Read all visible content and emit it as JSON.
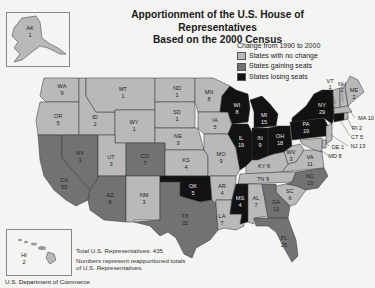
{
  "title": {
    "line1": "Apportionment of the U.S. House of Representatives",
    "line2": "Based on the 2000 Census"
  },
  "legend": {
    "heading": "Change from 1990 to 2000",
    "items": [
      {
        "label": "States with no change",
        "color": "#b9b9b9"
      },
      {
        "label": "States gaining seats",
        "color": "#727272"
      },
      {
        "label": "States losing seats",
        "color": "#121212"
      }
    ]
  },
  "colors": {
    "no_change": "#b9b9b9",
    "gaining": "#727272",
    "losing": "#121212",
    "background": "#f4f4f2"
  },
  "states": {
    "AK": {
      "abbr": "AK",
      "seats": "1",
      "status": "no_change"
    },
    "HI": {
      "abbr": "HI",
      "seats": "2",
      "status": "no_change"
    },
    "WA": {
      "abbr": "WA",
      "seats": "9",
      "status": "no_change"
    },
    "OR": {
      "abbr": "OR",
      "seats": "5",
      "status": "no_change"
    },
    "CA": {
      "abbr": "CA",
      "seats": "53",
      "status": "gaining"
    },
    "ID": {
      "abbr": "ID",
      "seats": "2",
      "status": "no_change"
    },
    "NV": {
      "abbr": "NV",
      "seats": "3",
      "status": "gaining"
    },
    "MT": {
      "abbr": "MT",
      "seats": "1",
      "status": "no_change"
    },
    "WY": {
      "abbr": "WY",
      "seats": "1",
      "status": "no_change"
    },
    "UT": {
      "abbr": "UT",
      "seats": "3",
      "status": "no_change"
    },
    "AZ": {
      "abbr": "AZ",
      "seats": "8",
      "status": "gaining"
    },
    "CO": {
      "abbr": "CO",
      "seats": "7",
      "status": "gaining"
    },
    "NM": {
      "abbr": "NM",
      "seats": "3",
      "status": "no_change"
    },
    "ND": {
      "abbr": "ND",
      "seats": "1",
      "status": "no_change"
    },
    "SD": {
      "abbr": "SD",
      "seats": "1",
      "status": "no_change"
    },
    "NE": {
      "abbr": "NE",
      "seats": "3",
      "status": "no_change"
    },
    "KS": {
      "abbr": "KS",
      "seats": "4",
      "status": "no_change"
    },
    "OK": {
      "abbr": "OK",
      "seats": "5",
      "status": "losing"
    },
    "TX": {
      "abbr": "TX",
      "seats": "32",
      "status": "gaining"
    },
    "MN": {
      "abbr": "MN",
      "seats": "8",
      "status": "no_change"
    },
    "IA": {
      "abbr": "IA",
      "seats": "5",
      "status": "no_change"
    },
    "MO": {
      "abbr": "MO",
      "seats": "9",
      "status": "no_change"
    },
    "AR": {
      "abbr": "AR",
      "seats": "4",
      "status": "no_change"
    },
    "LA": {
      "abbr": "LA",
      "seats": "7",
      "status": "no_change"
    },
    "WI": {
      "abbr": "WI",
      "seats": "8",
      "status": "losing"
    },
    "IL": {
      "abbr": "IL",
      "seats": "19",
      "status": "losing"
    },
    "MS": {
      "abbr": "MS",
      "seats": "4",
      "status": "losing"
    },
    "MI": {
      "abbr": "MI",
      "seats": "15",
      "status": "losing"
    },
    "IN": {
      "abbr": "IN",
      "seats": "9",
      "status": "losing"
    },
    "OH": {
      "abbr": "OH",
      "seats": "18",
      "status": "losing"
    },
    "KY": {
      "abbr": "KY",
      "seats": "6",
      "status": "no_change"
    },
    "TN": {
      "abbr": "TN",
      "seats": "9",
      "status": "no_change"
    },
    "AL": {
      "abbr": "AL",
      "seats": "7",
      "status": "no_change"
    },
    "GA": {
      "abbr": "GA",
      "seats": "13",
      "status": "gaining"
    },
    "FL": {
      "abbr": "FL",
      "seats": "25",
      "status": "gaining"
    },
    "SC": {
      "abbr": "SC",
      "seats": "6",
      "status": "no_change"
    },
    "NC": {
      "abbr": "NC",
      "seats": "13",
      "status": "gaining"
    },
    "VA": {
      "abbr": "VA",
      "seats": "11",
      "status": "no_change"
    },
    "WV": {
      "abbr": "WV",
      "seats": "3",
      "status": "no_change"
    },
    "PA": {
      "abbr": "PA",
      "seats": "19",
      "status": "losing"
    },
    "NY": {
      "abbr": "NY",
      "seats": "29",
      "status": "losing"
    },
    "VT": {
      "abbr": "VT",
      "seats": "1",
      "status": "no_change"
    },
    "NH": {
      "abbr": "NH",
      "seats": "2",
      "status": "no_change"
    },
    "ME": {
      "abbr": "ME",
      "seats": "2",
      "status": "no_change"
    },
    "MA": {
      "abbr": "MA",
      "seats": "10",
      "status": "no_change"
    },
    "RI": {
      "abbr": "RI",
      "seats": "2",
      "status": "no_change"
    },
    "CT": {
      "abbr": "CT",
      "seats": "5",
      "status": "losing"
    },
    "NJ": {
      "abbr": "NJ",
      "seats": "13",
      "status": "no_change"
    },
    "DE": {
      "abbr": "DE",
      "seats": "1",
      "status": "no_change"
    },
    "MD": {
      "abbr": "MD",
      "seats": "8",
      "status": "no_change"
    }
  },
  "callouts": {
    "MA": "MA 10",
    "RI": "RI 2",
    "CT": "CT 5",
    "NJ": "NJ 13",
    "DE": "DE 1",
    "MD": "MD 8",
    "KY": "KY 6",
    "TN": "TN 9"
  },
  "notes": {
    "total": "Total U.S. Representatives: 435",
    "numbers": "Numbers represent reapportioned totals of U.S. Representatives."
  },
  "source": "U.S. Department of Commerce"
}
